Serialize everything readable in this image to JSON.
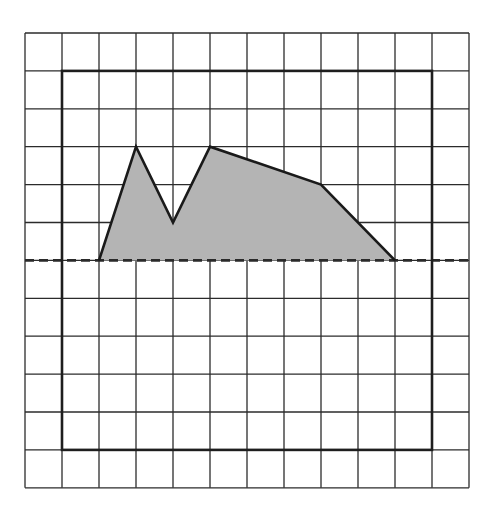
{
  "figure": {
    "grid": {
      "cols": 12,
      "rows": 12,
      "origin_px": [
        25,
        33
      ],
      "cell_w_px": 37,
      "cell_h_px": 37.9,
      "line_color": "#2b2b2b",
      "background": "#ffffff"
    },
    "bold_rectangle": {
      "from": [
        1,
        1
      ],
      "to": [
        11,
        11
      ],
      "stroke_color": "#1e1e1e"
    },
    "dashed_line": {
      "row": 6,
      "from_col": 0,
      "to_col": 12,
      "stroke_color": "#2a2a2a"
    },
    "polygon": {
      "vertices": [
        [
          2,
          6
        ],
        [
          3,
          3
        ],
        [
          4,
          5
        ],
        [
          5,
          3
        ],
        [
          8,
          4
        ],
        [
          10,
          6
        ]
      ],
      "fill_color": "#b4b4b4",
      "stroke_color": "#1a1a1a"
    }
  }
}
